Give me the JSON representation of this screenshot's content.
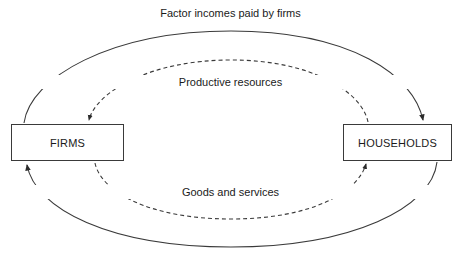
{
  "diagram": {
    "canvas": {
      "width": 461,
      "height": 265,
      "background": "#ffffff"
    },
    "line_color": "#3a3a3a",
    "text_color": "#1a1a1a",
    "nodes": [
      {
        "id": "firms",
        "label": "FIRMS"
      },
      {
        "id": "households",
        "label": "HOUSEHOLDS"
      }
    ],
    "flows": [
      {
        "id": "factor-incomes",
        "label": "Factor incomes paid by firms",
        "style": "solid",
        "from": "firms",
        "to": "households",
        "path": "outer-top"
      },
      {
        "id": "productive-resources",
        "label": "Productive resources",
        "style": "dashed",
        "from": "households",
        "to": "firms",
        "path": "inner-top"
      },
      {
        "id": "goods-and-services",
        "label": "Goods and services",
        "style": "dashed",
        "from": "firms",
        "to": "households",
        "path": "inner-bottom"
      },
      {
        "id": "consumer-expenditure",
        "label": "",
        "style": "solid",
        "from": "households",
        "to": "firms",
        "path": "outer-bottom"
      }
    ]
  }
}
